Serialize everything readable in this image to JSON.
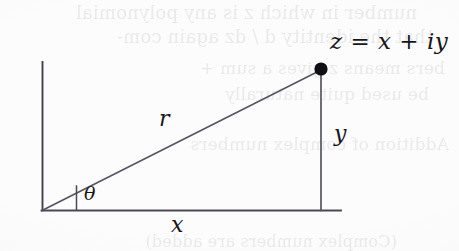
{
  "figure": {
    "kind": "right-triangle-diagram",
    "background_color": "#fcfcfd",
    "ink_color": "#3c3c46",
    "point_color": "#101014",
    "labels": {
      "point": {
        "z": "z",
        "equals": "=",
        "re": "x",
        "plus": "+",
        "im": "iy",
        "full": "z = x + iy"
      },
      "hypotenuse": "r",
      "vertical_leg": "y",
      "horizontal_leg": "x",
      "angle": "θ"
    },
    "geometry": {
      "origin": {
        "x": 42,
        "y": 210
      },
      "point": {
        "x": 321,
        "y": 69
      },
      "vertical_axis_top": {
        "x": 42,
        "y": 62
      },
      "horizontal_axis_end": {
        "x": 341,
        "y": 210
      },
      "angle_tick": {
        "x": 76,
        "top_y": 186,
        "bottom_y": 210
      },
      "point_dot_radius": 6.5
    }
  },
  "bleed_through": {
    "note": "faint mirrored text showing through from the reverse side of the scanned page",
    "lines": [
      {
        "text": "number in which z is any polynomial",
        "left": 42,
        "top": 2,
        "size": 18
      },
      {
        "text": "that the identity  d  / dz again com-",
        "left": 26,
        "top": 26,
        "size": 18
      },
      {
        "text": "bers means  z  gives a sum +",
        "left": 14,
        "top": 58,
        "size": 17
      },
      {
        "text": "be used quite naturally",
        "left": 30,
        "top": 84,
        "size": 17
      },
      {
        "text": "Addition of complex numbers",
        "left": 10,
        "top": 134,
        "size": 17
      },
      {
        "text": "(Complex numbers are added)",
        "left": 62,
        "top": 232,
        "size": 16
      }
    ]
  }
}
